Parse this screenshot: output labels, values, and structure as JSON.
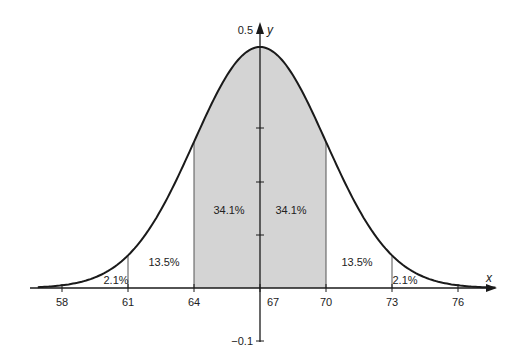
{
  "chart_data": {
    "type": "area",
    "title": "",
    "xlabel": "x",
    "ylabel": "y",
    "distribution": {
      "mean": 67,
      "sd": 3
    },
    "x_ticks": [
      58,
      61,
      64,
      67,
      70,
      73,
      76
    ],
    "y_tick_labels": {
      "top": "0.5",
      "bottom": "−0.1"
    },
    "ylim": [
      -0.1,
      0.5
    ],
    "grid": false,
    "legend": null,
    "shaded_region": [
      64,
      70
    ],
    "regions": [
      {
        "from": 58,
        "to": 61,
        "label": "2.1%"
      },
      {
        "from": 61,
        "to": 64,
        "label": "13.5%"
      },
      {
        "from": 64,
        "to": 67,
        "label": "34.1%"
      },
      {
        "from": 67,
        "to": 70,
        "label": "34.1%"
      },
      {
        "from": 70,
        "to": 73,
        "label": "13.5%"
      },
      {
        "from": 73,
        "to": 76,
        "label": "2.1%"
      }
    ],
    "colors": {
      "shade": "#d4d4d4",
      "line": "#1a1a1a"
    }
  }
}
